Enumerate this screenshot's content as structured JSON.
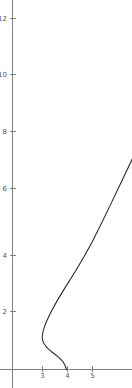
{
  "chart_data": {
    "type": "line",
    "title": "",
    "xlabel": "",
    "ylabel": "",
    "xlim": [
      -1.32,
      6.0
    ],
    "ylim": [
      -0.6,
      12.6
    ],
    "grid": false,
    "legend": null,
    "x_ticks": [
      3,
      4,
      5
    ],
    "x_tick_labels": [
      "3",
      "4",
      "5"
    ],
    "y_ticks": [
      2,
      4,
      6,
      8,
      10,
      12
    ],
    "y_tick_labels": [
      "2",
      "4",
      "6",
      "8",
      "10",
      "12"
    ],
    "axis_color": "#808080",
    "curve_color": "#2b2b2b",
    "background_color": "#ffffff",
    "series": [
      {
        "name": "curve",
        "points": [
          [
            3.96,
            0.0
          ],
          [
            3.9,
            0.15
          ],
          [
            3.8,
            0.3
          ],
          [
            3.66,
            0.42
          ],
          [
            3.5,
            0.54
          ],
          [
            3.35,
            0.64
          ],
          [
            3.22,
            0.74
          ],
          [
            3.12,
            0.84
          ],
          [
            3.04,
            0.95
          ],
          [
            3.0,
            1.05
          ],
          [
            2.99,
            1.15
          ],
          [
            3.0,
            1.25
          ],
          [
            3.03,
            1.38
          ],
          [
            3.08,
            1.52
          ],
          [
            3.14,
            1.66
          ],
          [
            3.22,
            1.82
          ],
          [
            3.3,
            1.97
          ],
          [
            3.4,
            2.14
          ],
          [
            3.5,
            2.3
          ],
          [
            3.6,
            2.46
          ],
          [
            3.71,
            2.62
          ],
          [
            3.82,
            2.78
          ],
          [
            3.92,
            2.93
          ],
          [
            4.03,
            3.08
          ],
          [
            4.13,
            3.22
          ],
          [
            4.24,
            3.38
          ],
          [
            4.34,
            3.52
          ],
          [
            4.44,
            3.67
          ],
          [
            4.54,
            3.82
          ],
          [
            4.64,
            3.97
          ],
          [
            4.74,
            4.13
          ],
          [
            4.86,
            4.32
          ],
          [
            5.0,
            4.55
          ],
          [
            5.2,
            4.9
          ],
          [
            5.45,
            5.35
          ],
          [
            5.75,
            5.9
          ],
          [
            6.1,
            6.55
          ],
          [
            6.5,
            7.3
          ],
          [
            6.95,
            8.15
          ],
          [
            7.45,
            9.1
          ],
          [
            8.0,
            10.15
          ],
          [
            8.55,
            11.2
          ],
          [
            9.0,
            12.05
          ]
        ]
      }
    ]
  }
}
